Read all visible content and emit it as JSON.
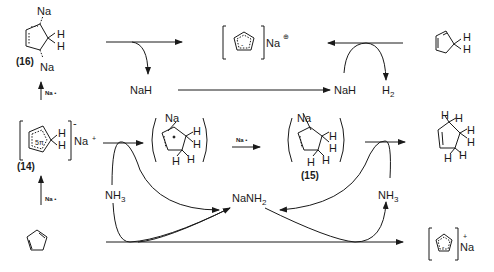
{
  "diagram": {
    "compounds": {
      "c16": {
        "label": "(16)",
        "na_top": "Na",
        "na_bottom": "Na",
        "h1": "H",
        "h2": "H"
      },
      "c14": {
        "label": "(14)",
        "ring_text": "5π",
        "charge": "-",
        "counterion": "Na",
        "cation_charge": "+",
        "h1": "H",
        "h2": "H"
      },
      "cpd": {
        "name": "cyclopentadiene"
      },
      "cpna_top": {
        "ring_charge": "-",
        "counterion": "Na",
        "charge": "⊕"
      },
      "cpd_right": {
        "h1": "H",
        "h2": "H"
      },
      "intermediate_radical": {
        "na": "Na",
        "h": [
          "H",
          "H",
          "H",
          "H"
        ]
      },
      "c15": {
        "label": "(15)",
        "na": "Na",
        "h": [
          "H",
          "H",
          "H",
          "H"
        ]
      },
      "cyclopentene": {
        "h": [
          "H",
          "H",
          "H",
          "H",
          "H",
          "H"
        ]
      },
      "cpna_bottom": {
        "ring_charge": "-",
        "counterion": "Na",
        "charge": "+"
      }
    },
    "reagents": {
      "na_up_top": "Na •",
      "na_up_bottom": "Na •",
      "na_mid": "Na •",
      "nah_left": "NaH",
      "nah_right": "NaH",
      "h2": "H",
      "h2_sub": "2",
      "nh3_left": "NH",
      "nh3_left_sub": "3",
      "nh3_right": "NH",
      "nh3_right_sub": "3",
      "nanh2": "NaNH",
      "nanh2_sub": "2"
    }
  }
}
